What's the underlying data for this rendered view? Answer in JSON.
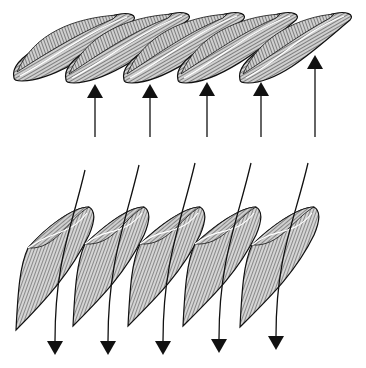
{
  "diagram": {
    "type": "cascade-blade-flow",
    "colors": {
      "background": "#ffffff",
      "ink": "#111111",
      "blade_fill": "#bdbdbd",
      "hatch": "#333333"
    },
    "top_row": {
      "blade_count": 5,
      "blades": [
        {
          "x1": 14,
          "y1": 78,
          "x2": 135,
          "y2": 13
        },
        {
          "x1": 66,
          "y1": 80,
          "x2": 190,
          "y2": 12
        },
        {
          "x1": 124,
          "y1": 80,
          "x2": 245,
          "y2": 12
        },
        {
          "x1": 178,
          "y1": 80,
          "x2": 298,
          "y2": 12
        },
        {
          "x1": 240,
          "y1": 80,
          "x2": 352,
          "y2": 12
        }
      ],
      "arrows": [
        {
          "x": 95,
          "head_y": 84,
          "tail_y": 137,
          "direction": "up"
        },
        {
          "x": 150,
          "head_y": 84,
          "tail_y": 137,
          "direction": "up"
        },
        {
          "x": 207,
          "head_y": 82,
          "tail_y": 137,
          "direction": "up"
        },
        {
          "x": 261,
          "head_y": 82,
          "tail_y": 137,
          "direction": "up"
        },
        {
          "x": 315,
          "head_y": 55,
          "tail_y": 137,
          "direction": "up"
        }
      ]
    },
    "bottom_row": {
      "blade_count": 5,
      "blades": [
        {
          "x1": 16,
          "y1": 330,
          "x2": 93,
          "y2": 207
        },
        {
          "x1": 73,
          "y1": 326,
          "x2": 148,
          "y2": 207
        },
        {
          "x1": 128,
          "y1": 326,
          "x2": 204,
          "y2": 207
        },
        {
          "x1": 183,
          "y1": 326,
          "x2": 260,
          "y2": 207
        },
        {
          "x1": 240,
          "y1": 327,
          "x2": 318,
          "y2": 207
        }
      ],
      "arrows": [
        {
          "start_x": 85,
          "start_y": 170,
          "end_x": 55,
          "end_y": 355,
          "direction": "down"
        },
        {
          "start_x": 139,
          "start_y": 165,
          "end_x": 108,
          "end_y": 355,
          "direction": "down"
        },
        {
          "start_x": 195,
          "start_y": 163,
          "end_x": 163,
          "end_y": 355,
          "direction": "down"
        },
        {
          "start_x": 251,
          "start_y": 163,
          "end_x": 219,
          "end_y": 353,
          "direction": "down"
        },
        {
          "start_x": 308,
          "start_y": 163,
          "end_x": 276,
          "end_y": 350,
          "direction": "down"
        }
      ]
    }
  }
}
